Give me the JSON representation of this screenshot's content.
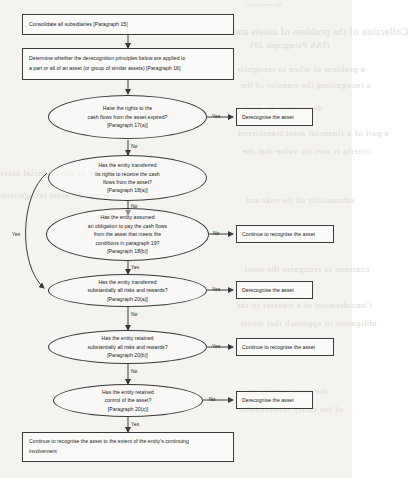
{
  "document": {
    "type": "flowchart",
    "title": "Derecognition of financial assets decision tree",
    "background_color": "#f4f3ef",
    "line_color": "#3a3a3a",
    "text_color": "#1d1d1d"
  },
  "bleed_through_text": [
    "Derecognition",
    "Collection of the problem of assets and",
    "(IAS Paragraph 20)",
    "a problem of when to recognise",
    "a recognising the transfer of the",
    "derecognise the asset",
    "a part of a financial asset transferred",
    "criteria is met for value that the",
    "recognise of the financial asset",
    "is not the asset recognition",
    "substantially all the risks and",
    "continue to recognise the asset",
    "Consideration of a transfer in the",
    "obligation to approach that meets",
    "the asset continuing",
    "of the entity involvement"
  ],
  "nodes": {
    "start": {
      "id": "consolidate",
      "shape": "rectangle",
      "lines": [
        "Consolidate all subsidiaries [Paragraph 15]"
      ]
    },
    "scope": {
      "id": "determine-scope",
      "shape": "rectangle",
      "lines": [
        "Determine whether the derecognition principles below are applied to",
        "a part or all of an asset (or group of similar assets)  [Paragraph 16]"
      ]
    },
    "d1": {
      "id": "rights-expired",
      "shape": "ellipse",
      "lines": [
        "Have the rights to the",
        "cash flows from the asset expired?",
        "[Paragraph 17(a)]"
      ]
    },
    "d2": {
      "id": "transferred-rights",
      "shape": "ellipse",
      "lines": [
        "Has the entity transferred",
        "its rights to receive the cash",
        "flows from the asset?",
        "[Paragraph 18(a)]"
      ]
    },
    "d3": {
      "id": "assumed-obligation",
      "shape": "ellipse",
      "lines": [
        "Has the entity assumed",
        "an obligation to pay the cash flows",
        "from the asset that meets the",
        "conditions in paragraph 19?",
        "[Paragraph 18(b)]"
      ]
    },
    "d4": {
      "id": "transferred-risks-rewards",
      "shape": "ellipse",
      "lines": [
        "Has the entity transferred",
        "substantially all risks and rewards?",
        "[Paragraph 20(a)]"
      ]
    },
    "d5": {
      "id": "retained-risks-rewards",
      "shape": "ellipse",
      "lines": [
        "Has the entity retained",
        "substantially all risks and rewards?",
        "[Paragraph 20(b)]"
      ]
    },
    "d6": {
      "id": "retained-control",
      "shape": "ellipse",
      "lines": [
        "Has the entity retained",
        "control of the asset?",
        "[Paragraph 20(c)]"
      ]
    },
    "out1": {
      "id": "derecognise-1",
      "shape": "rectangle",
      "label": "Derecognise the asset"
    },
    "out2": {
      "id": "continue-1",
      "shape": "rectangle",
      "label": "Continue to recognise the asset"
    },
    "out3": {
      "id": "derecognise-2",
      "shape": "rectangle",
      "label": "Derecognise the asset"
    },
    "out4": {
      "id": "continue-2",
      "shape": "rectangle",
      "label": "Continue to recognise the asset"
    },
    "out5": {
      "id": "derecognise-3",
      "shape": "rectangle",
      "label": "Derecognise the asset"
    },
    "final": {
      "id": "continue-extent",
      "shape": "rectangle",
      "lines": [
        "Continue to recognise the asset to the extent of the entity's continuing",
        "involvement"
      ]
    }
  },
  "edge_labels": {
    "d1_yes": "Yes",
    "d1_no": "No",
    "d2_no": "No",
    "d2_yes": "Yes",
    "d3_no": "No",
    "d3_yes": "Yes",
    "d4_yes": "Yes",
    "d4_no": "No",
    "d5_yes": "Yes",
    "d5_no": "No",
    "d6_no": "No",
    "d6_yes": "Yes"
  }
}
